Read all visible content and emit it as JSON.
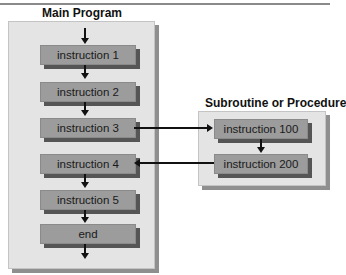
{
  "main_program": {
    "title": "Main Program",
    "steps": [
      {
        "label": "instruction 1"
      },
      {
        "label": "instruction 2"
      },
      {
        "label": "instruction 3"
      },
      {
        "label": "instruction 4"
      },
      {
        "label": "instruction 5"
      },
      {
        "label": "end"
      }
    ]
  },
  "subroutine": {
    "title": "Subroutine or Procedure",
    "steps": [
      {
        "label": "instruction 100"
      },
      {
        "label": "instruction 200"
      }
    ]
  },
  "connections": [
    {
      "from": "instruction 3",
      "to": "instruction 100",
      "kind": "call"
    },
    {
      "from": "instruction 200",
      "to": "instruction 4",
      "kind": "return"
    }
  ],
  "colors": {
    "panel_bg": "#e4e4e4",
    "box_fill": "#9c9c9c",
    "box_shadow": "#555555",
    "arrow": "#111111"
  }
}
